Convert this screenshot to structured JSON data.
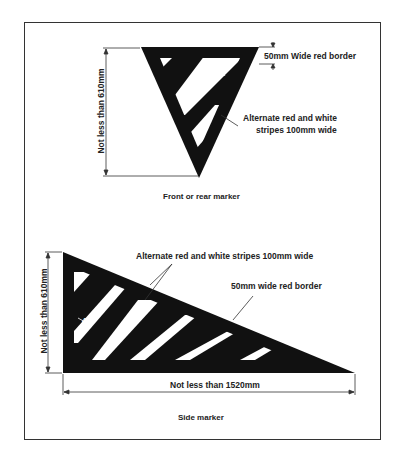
{
  "front_marker": {
    "caption": "Front or rear marker",
    "height_label": "Not less than 610mm",
    "border_label": "50mm Wide red border",
    "stripes_label_line1": "Alternate red and white",
    "stripes_label_line2": "stripes 100mm wide",
    "angle_label": "45°"
  },
  "side_marker": {
    "caption": "Side marker",
    "height_label": "Not less than 610mm",
    "width_label": "Not less than 1520mm",
    "stripes_label": "Alternate red and white stripes 100mm wide",
    "border_label": "50mm wide red border",
    "angle_label": "45°"
  },
  "colors": {
    "marker_fill": "#111111",
    "stripe_white": "#ffffff",
    "line": "#333333"
  }
}
